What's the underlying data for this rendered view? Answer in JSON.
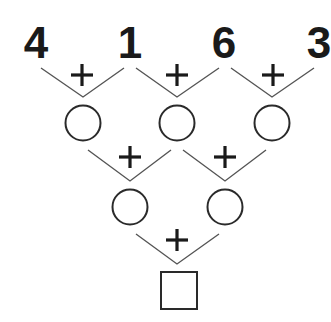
{
  "puzzle": {
    "type": "addition-pyramid",
    "operator": "+",
    "top_row": [
      "4",
      "1",
      "6",
      "3"
    ],
    "row2_blanks": 3,
    "row3_blanks": 2,
    "answer_blank_shape": "square"
  },
  "colors": {
    "ink": "#1a1a1a",
    "lines": "#555555",
    "background": "#ffffff"
  }
}
